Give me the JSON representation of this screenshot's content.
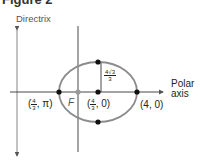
{
  "figure": {
    "title": "Figure 2"
  },
  "labels": {
    "directrix": "Directrix",
    "polar_axis_line1": "Polar",
    "polar_axis_line2": "axis",
    "focus": "F",
    "left_vertex": {
      "num": "4",
      "den": "3",
      "angle": "π"
    },
    "center": {
      "num": "4",
      "den": "3",
      "angle": "0"
    },
    "right_vertex": "(4, 0)",
    "minor_semi_axis": {
      "num": "4√3",
      "den": "3"
    }
  },
  "colors": {
    "ellipse": "#8c8c8c",
    "axis": "#333333",
    "point": "#111111",
    "focus_point": "#9a9a9a"
  }
}
